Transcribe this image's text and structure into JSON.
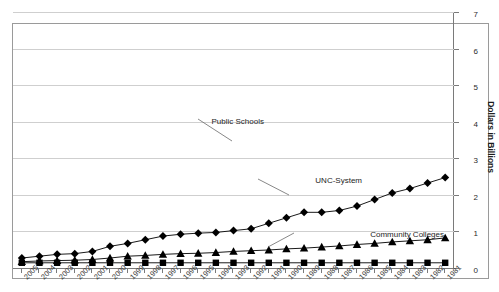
{
  "chart_data": {
    "type": "line",
    "title": "",
    "xlabel": "",
    "ylabel": "Dollars in Billions",
    "ylim": [
      0,
      7
    ],
    "yticks": [
      0,
      1,
      2,
      3,
      4,
      5,
      6,
      7
    ],
    "ytick_labels": [
      "0",
      "1",
      "2",
      "3",
      "4",
      "5",
      "6",
      "7"
    ],
    "grid": true,
    "legend": "none (series labelled inline with leader lines)",
    "orientation_note": "entire figure rendered rotated 180 degrees",
    "categories": [
      "1981",
      "1982",
      "1983",
      "1984",
      "1985",
      "1986",
      "1987",
      "1988",
      "1989",
      "1990",
      "1991",
      "1992",
      "1993",
      "1994",
      "1995",
      "1996",
      "1997",
      "1998",
      "1999",
      "2000",
      "2001",
      "2002",
      "2003",
      "2004",
      "2005"
    ],
    "series": [
      {
        "name": "Public Schools",
        "marker": "diamond",
        "values": [
          2.5,
          2.35,
          2.2,
          2.08,
          1.9,
          1.72,
          1.6,
          1.55,
          1.55,
          1.4,
          1.25,
          1.1,
          1.05,
          1.0,
          0.98,
          0.95,
          0.9,
          0.8,
          0.7,
          0.62,
          0.48,
          0.42,
          0.4,
          0.35,
          0.3
        ]
      },
      {
        "name": "UNC-System",
        "marker": "triangle",
        "values": [
          0.85,
          0.8,
          0.77,
          0.74,
          0.7,
          0.67,
          0.63,
          0.6,
          0.57,
          0.55,
          0.52,
          0.5,
          0.48,
          0.45,
          0.43,
          0.42,
          0.4,
          0.37,
          0.35,
          0.3,
          0.26,
          0.24,
          0.23,
          0.22,
          0.2
        ]
      },
      {
        "name": "Community Colleges",
        "marker": "square",
        "values": [
          0.17,
          0.17,
          0.17,
          0.17,
          0.17,
          0.17,
          0.17,
          0.17,
          0.17,
          0.17,
          0.17,
          0.17,
          0.17,
          0.17,
          0.17,
          0.17,
          0.17,
          0.17,
          0.17,
          0.17,
          0.17,
          0.17,
          0.17,
          0.17,
          0.17
        ]
      }
    ],
    "annotations": [
      {
        "label": "Public Schools"
      },
      {
        "label": "UNC-System"
      },
      {
        "label": "Community Colleges"
      }
    ],
    "colors": {
      "line": "#000000",
      "grid": "#cfcfcf",
      "axis": "#7a7a7a",
      "text": "#1c1c1c"
    }
  },
  "annotations": {
    "public_schools": "Public Schools",
    "unc_system": "UNC-System",
    "community_colleges": "Community Colleges"
  }
}
